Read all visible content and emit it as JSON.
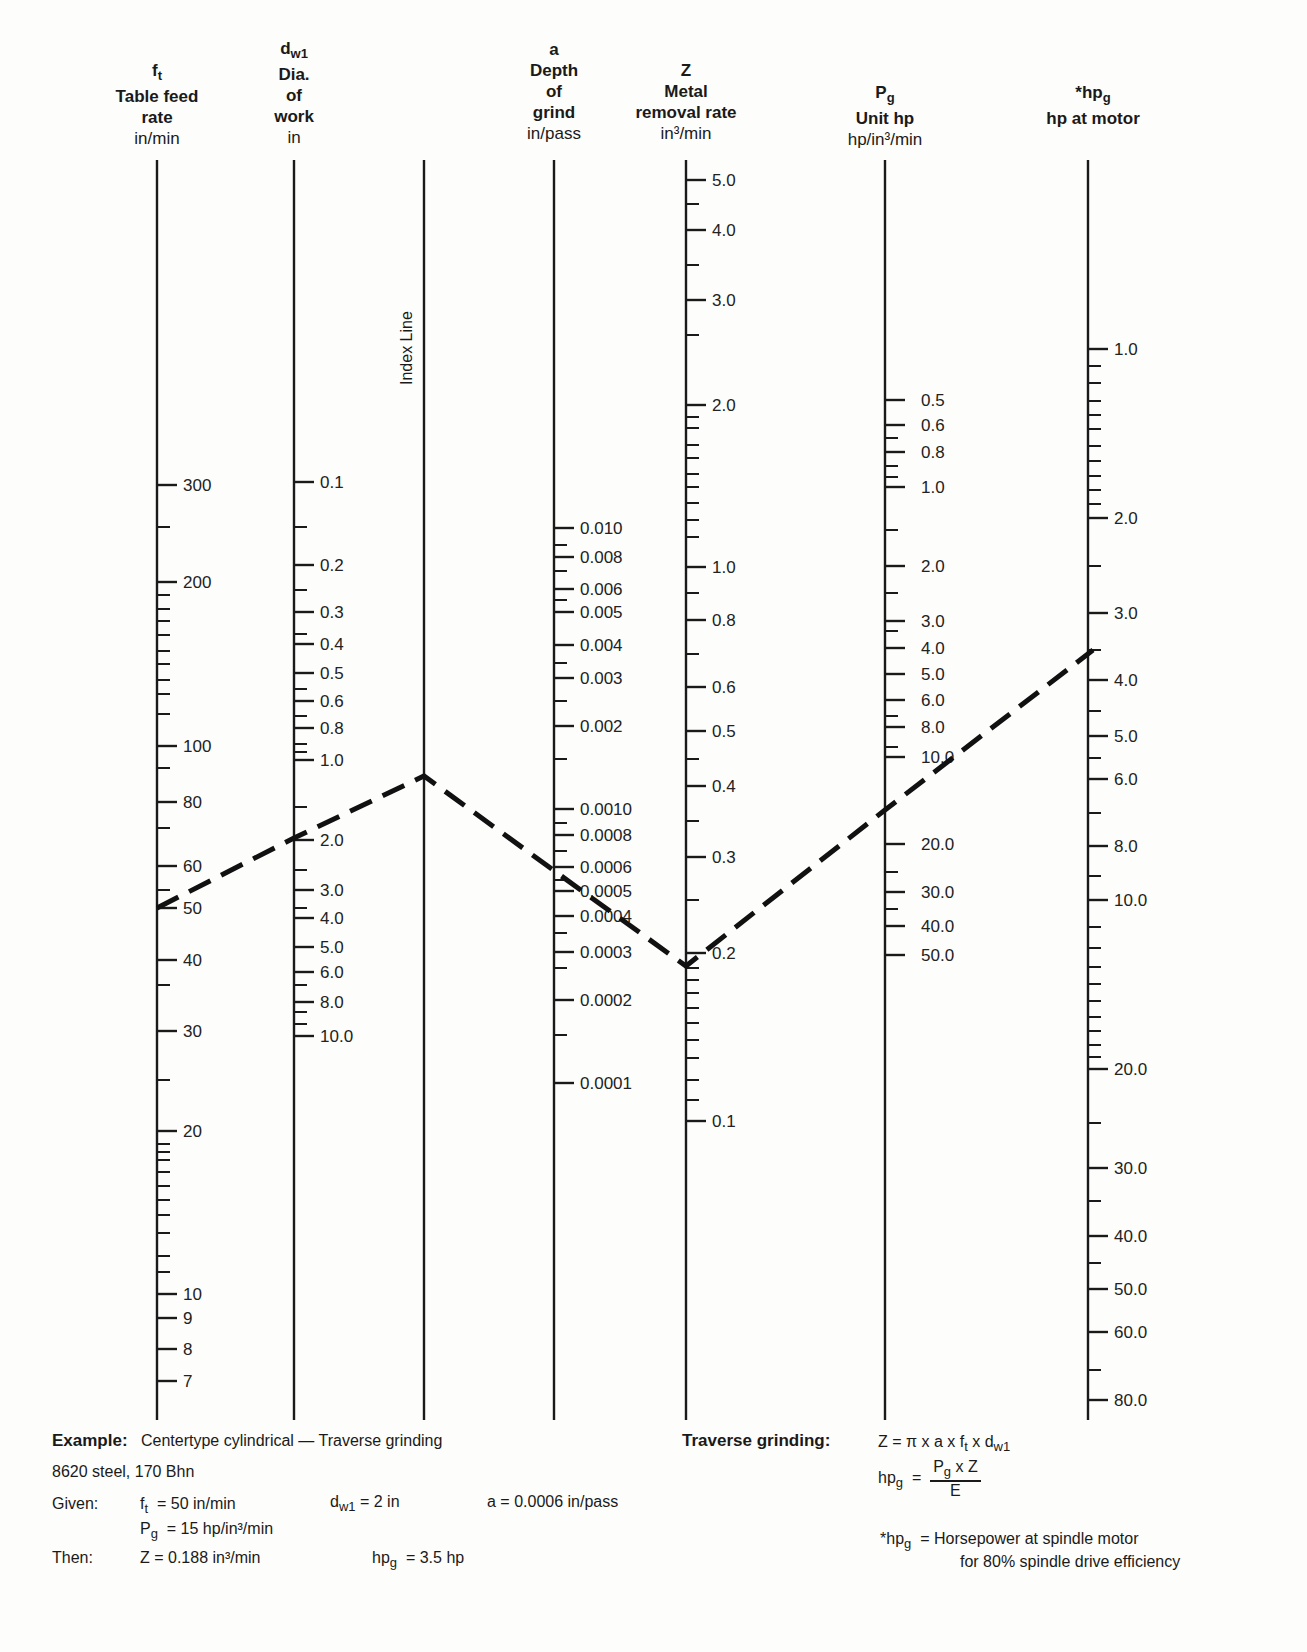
{
  "axes": [
    {
      "id": "ft",
      "symbol": "f",
      "symbol_sub": "t",
      "title_lines": [
        "Table feed",
        "rate"
      ],
      "unit": "in/min",
      "x": 157
    },
    {
      "id": "dw1",
      "symbol": "d",
      "symbol_sub": "w1",
      "title_lines": [
        "Dia.",
        "of",
        "work"
      ],
      "unit": "in",
      "x": 294
    },
    {
      "id": "index",
      "symbol": "",
      "title_lines": [],
      "unit": "",
      "x": 424,
      "label": "Index Line"
    },
    {
      "id": "a",
      "symbol": "a",
      "symbol_sub": "",
      "title_lines": [
        "Depth",
        "of",
        "grind"
      ],
      "unit": "in/pass",
      "x": 554
    },
    {
      "id": "Z",
      "symbol": "Z",
      "symbol_sub": "",
      "title_lines": [
        "Metal",
        "removal rate"
      ],
      "unit": "in³/min",
      "x": 686
    },
    {
      "id": "Pg",
      "symbol": "P",
      "symbol_sub": "g",
      "title_lines": [
        "Unit hp"
      ],
      "unit": "hp/in³/min",
      "x": 885
    },
    {
      "id": "hpg",
      "symbol": "*hp",
      "symbol_sub": "g",
      "title_lines": [
        "hp at motor"
      ],
      "unit": "",
      "x": 1088
    }
  ],
  "chart_data": {
    "type": "nomogram",
    "scales": [
      {
        "id": "ft",
        "name": "Table feed rate",
        "unit": "in/min",
        "labeled_ticks": [
          {
            "v": "300",
            "y": 485
          },
          {
            "v": "200",
            "y": 582
          },
          {
            "v": "100",
            "y": 746
          },
          {
            "v": "80",
            "y": 802
          },
          {
            "v": "60",
            "y": 866
          },
          {
            "v": "50",
            "y": 908
          },
          {
            "v": "40",
            "y": 960
          },
          {
            "v": "30",
            "y": 1031
          },
          {
            "v": "20",
            "y": 1131
          },
          {
            "v": "10",
            "y": 1294
          },
          {
            "v": "9",
            "y": 1318
          },
          {
            "v": "8",
            "y": 1349
          },
          {
            "v": "7",
            "y": 1381
          }
        ],
        "minor_ticks": [
          527,
          595,
          609,
          621,
          635,
          651,
          664,
          680,
          694,
          714,
          768,
          828,
          890,
          985,
          1080,
          1144,
          1152,
          1160,
          1172,
          1186,
          1200,
          1215,
          1233,
          1256,
          1272
        ]
      },
      {
        "id": "dw1",
        "name": "Dia. of work",
        "unit": "in",
        "labeled_ticks": [
          {
            "v": "0.1",
            "y": 482
          },
          {
            "v": "0.2",
            "y": 565
          },
          {
            "v": "0.3",
            "y": 612
          },
          {
            "v": "0.4",
            "y": 644
          },
          {
            "v": "0.5",
            "y": 673
          },
          {
            "v": "0.6",
            "y": 701
          },
          {
            "v": "0.8",
            "y": 728
          },
          {
            "v": "1.0",
            "y": 760
          },
          {
            "v": "2.0",
            "y": 840
          },
          {
            "v": "3.0",
            "y": 890
          },
          {
            "v": "4.0",
            "y": 918
          },
          {
            "v": "5.0",
            "y": 947
          },
          {
            "v": "6.0",
            "y": 972
          },
          {
            "v": "8.0",
            "y": 1002
          },
          {
            "v": "10.0",
            "y": 1036
          }
        ],
        "minor_ticks": [
          527,
          590,
          634,
          689,
          716,
          744,
          752,
          807,
          870,
          908,
          985,
          1012,
          1024
        ]
      },
      {
        "id": "a",
        "name": "Depth of grind",
        "unit": "in/pass",
        "labeled_ticks": [
          {
            "v": "0.010",
            "y": 528
          },
          {
            "v": "0.008",
            "y": 557
          },
          {
            "v": "0.006",
            "y": 589
          },
          {
            "v": "0.005",
            "y": 612
          },
          {
            "v": "0.004",
            "y": 645
          },
          {
            "v": "0.003",
            "y": 678
          },
          {
            "v": "0.002",
            "y": 726
          },
          {
            "v": "0.0010",
            "y": 809
          },
          {
            "v": "0.0008",
            "y": 835
          },
          {
            "v": "0.0006",
            "y": 867
          },
          {
            "v": "0.0005",
            "y": 891
          },
          {
            "v": "0.0004",
            "y": 916
          },
          {
            "v": "0.0003",
            "y": 952
          },
          {
            "v": "0.0002",
            "y": 1000
          },
          {
            "v": "0.0001",
            "y": 1083
          }
        ],
        "minor_ticks": [
          545,
          571,
          600,
          663,
          701,
          759,
          823,
          851,
          880,
          933,
          968,
          1035
        ]
      },
      {
        "id": "Z",
        "name": "Metal removal rate",
        "unit": "in³/min",
        "labeled_ticks": [
          {
            "v": "5.0",
            "y": 180
          },
          {
            "v": "4.0",
            "y": 230
          },
          {
            "v": "3.0",
            "y": 300
          },
          {
            "v": "2.0",
            "y": 405
          },
          {
            "v": "1.0",
            "y": 567
          },
          {
            "v": "0.8",
            "y": 620
          },
          {
            "v": "0.6",
            "y": 687
          },
          {
            "v": "0.5",
            "y": 731
          },
          {
            "v": "0.4",
            "y": 786
          },
          {
            "v": "0.3",
            "y": 857
          },
          {
            "v": "0.2",
            "y": 953
          },
          {
            "v": "0.1",
            "y": 1121
          }
        ],
        "minor_ticks": [
          204,
          265,
          335,
          417,
          428,
          445,
          458,
          474,
          487,
          503,
          520,
          537,
          593,
          654,
          759,
          821,
          900,
          968,
          980,
          993,
          1008,
          1023,
          1040,
          1058,
          1080,
          1100
        ]
      },
      {
        "id": "Pg",
        "name": "Unit hp",
        "unit": "hp/in³/min",
        "labeled_ticks": [
          {
            "v": "0.5",
            "y": 400
          },
          {
            "v": "0.6",
            "y": 425
          },
          {
            "v": "0.8",
            "y": 452
          },
          {
            "v": "1.0",
            "y": 487
          },
          {
            "v": "2.0",
            "y": 566
          },
          {
            "v": "3.0",
            "y": 621
          },
          {
            "v": "4.0",
            "y": 648
          },
          {
            "v": "5.0",
            "y": 674
          },
          {
            "v": "6.0",
            "y": 700
          },
          {
            "v": "8.0",
            "y": 727
          },
          {
            "v": "10.0",
            "y": 757
          },
          {
            "v": "20.0",
            "y": 844
          },
          {
            "v": "30.0",
            "y": 892
          },
          {
            "v": "40.0",
            "y": 926
          },
          {
            "v": "50.0",
            "y": 955
          }
        ],
        "minor_ticks": [
          438,
          466,
          477,
          530,
          593,
          631,
          716,
          747,
          872,
          909
        ]
      },
      {
        "id": "hpg",
        "name": "hp at motor",
        "unit": "",
        "labeled_ticks": [
          {
            "v": "1.0",
            "y": 349
          },
          {
            "v": "2.0",
            "y": 518
          },
          {
            "v": "3.0",
            "y": 613
          },
          {
            "v": "4.0",
            "y": 680
          },
          {
            "v": "5.0",
            "y": 736
          },
          {
            "v": "6.0",
            "y": 779
          },
          {
            "v": "8.0",
            "y": 846
          },
          {
            "v": "10.0",
            "y": 900
          },
          {
            "v": "20.0",
            "y": 1069
          },
          {
            "v": "30.0",
            "y": 1168
          },
          {
            "v": "40.0",
            "y": 1236
          },
          {
            "v": "50.0",
            "y": 1289
          },
          {
            "v": "60.0",
            "y": 1332
          },
          {
            "v": "80.0",
            "y": 1400
          }
        ],
        "minor_ticks": [
          366,
          383,
          401,
          415,
          429,
          446,
          461,
          476,
          490,
          504,
          566,
          650,
          711,
          758,
          813,
          876,
          927,
          948,
          967,
          984,
          1001,
          1017,
          1031,
          1045,
          1057,
          1123,
          1201,
          1263,
          1370
        ]
      }
    ],
    "example_path": [
      {
        "axis": "ft",
        "value": "50",
        "x": 157,
        "y": 908
      },
      {
        "axis": "dw1",
        "value": "2.0",
        "x": 294,
        "y": 838
      },
      {
        "axis": "index",
        "value": "",
        "x": 424,
        "y": 776
      },
      {
        "axis": "a",
        "value": "0.0006",
        "x": 560,
        "y": 875
      },
      {
        "axis": "Z",
        "value": "0.188",
        "x": 686,
        "y": 966
      },
      {
        "axis": "Pg",
        "value": "15",
        "x": 885,
        "y": 810
      },
      {
        "axis": "hpg",
        "value": "3.5",
        "x": 1093,
        "y": 650
      }
    ]
  },
  "example": {
    "heading": "Example:",
    "heading_text": "Centertype cylindrical — Traverse grinding",
    "material": "8620 steel, 170 Bhn",
    "given_label": "Given:",
    "given_ft": "= 50 in/min",
    "given_dw1": "= 2 in",
    "given_a": "a = 0.0006 in/pass",
    "given_pg": "= 15 hp/in³/min",
    "then_label": "Then:",
    "then_z": "Z = 0.188 in³/min",
    "then_hpg": "= 3.5 hp"
  },
  "formulas": {
    "heading": "Traverse grinding:",
    "z_formula": "Z = π x a x f",
    "z_tail": " x d",
    "hpg_eq": "=",
    "hpg_num": "P",
    "hpg_num_tail": " x Z",
    "hpg_den": "E",
    "note_line1": "= Horsepower at spindle motor",
    "note_line2": "for 80% spindle drive efficiency"
  }
}
